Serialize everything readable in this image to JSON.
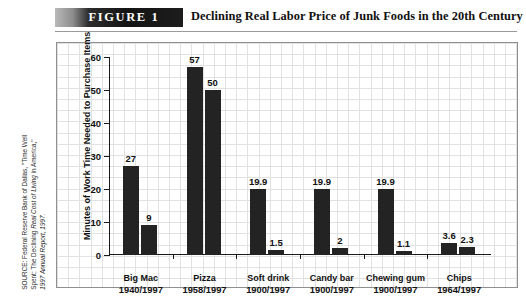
{
  "header": {
    "figure_tag": "FIGURE  1",
    "title": "Declining Real Labor Price of Junk Foods in the 20th Century"
  },
  "source": {
    "line1": "SOURCE: Federal Reserve Bank of Dallas, \"Time Well",
    "line2_plain": "Spent: The Declining ",
    "line2_italic": "Real Cost of Living",
    "line2_tail": " in America,\"",
    "line3": "1997 Annual Report, 1997."
  },
  "chart_data": {
    "type": "bar",
    "title": "Declining Real Labor Price of Junk Foods in the 20th Century",
    "xlabel": "",
    "ylabel": "Minutes of Work Time Needed to Purchase Items",
    "ylim": [
      0,
      60
    ],
    "yticks": [
      0,
      10,
      20,
      30,
      40,
      50,
      60
    ],
    "grid": true,
    "legend": "none",
    "categories": [
      "Big Mac",
      "Pizza",
      "Soft drink",
      "Candy bar",
      "Chewing gum",
      "Chips"
    ],
    "category_years": [
      "1940/1997",
      "1958/1997",
      "1900/1997",
      "1900/1997",
      "1900/1997",
      "1964/1997"
    ],
    "series": [
      {
        "name": "Earlier year",
        "values": [
          27,
          57,
          19.9,
          19.9,
          19.9,
          3.6
        ]
      },
      {
        "name": "1997",
        "values": [
          9,
          50,
          1.5,
          2,
          1.1,
          2.3
        ]
      }
    ],
    "value_labels": [
      [
        "27",
        "9"
      ],
      [
        "57",
        "50"
      ],
      [
        "19.9",
        "1.5"
      ],
      [
        "19.9",
        "2"
      ],
      [
        "19.9",
        "1.1"
      ],
      [
        "3.6",
        "2.3"
      ]
    ]
  },
  "colors": {
    "bar": "#232323",
    "axis": "#1a1a1a",
    "grid": "#e2e2e2",
    "frame": "#8f8f8f"
  }
}
